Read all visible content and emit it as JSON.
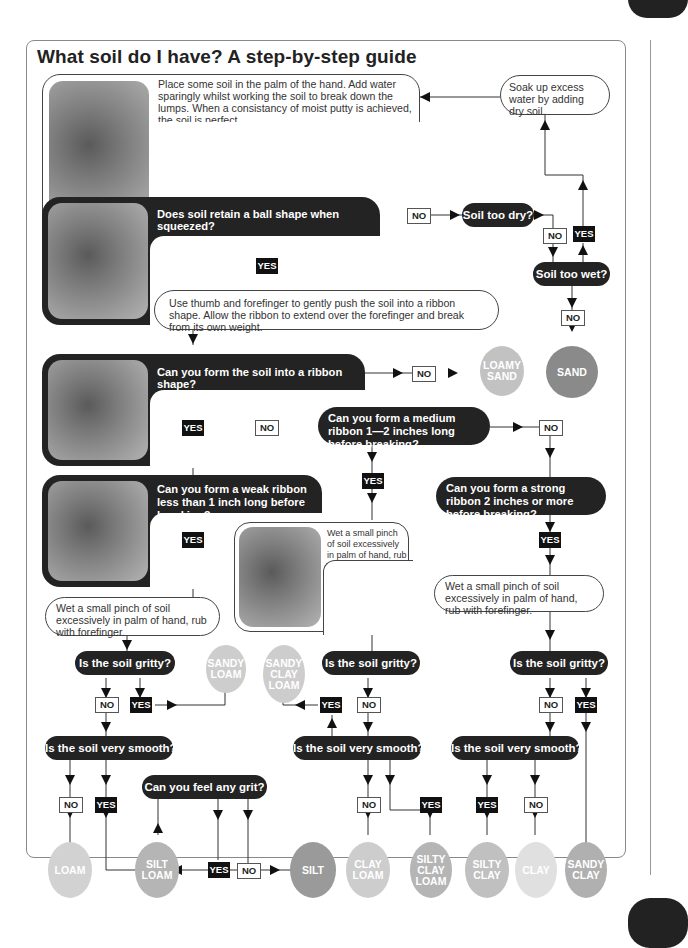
{
  "title": "What soil do I have? A step-by-step guide",
  "instructions": {
    "moisten": "Place some soil in the palm of the hand. Add water sparingly whilst working the soil to break down the lumps. When a consistancy of moist putty is achieved, the soil is perfect.",
    "soak": "Soak up excess water by adding dry soil.",
    "ribbon": "Use thumb and forefinger to gently push the soil into a ribbon shape. Allow the ribbon to extend over the forefinger and break from its own weight.",
    "wet_pinch": "Wet a small pinch of soil excessively in palm of hand, rub with forefinger."
  },
  "questions": {
    "ball": "Does soil retain a ball shape when squeezed?",
    "too_dry": "Soil too dry?",
    "too_wet": "Soil too wet?",
    "form_ribbon": "Can you form the soil into a ribbon shape?",
    "medium_ribbon": "Can you form a medium ribbon 1—2 inches long before breaking?",
    "weak_ribbon": "Can you form a weak ribbon less than 1 inch long before breaking?",
    "strong_ribbon": "Can you form a strong ribbon 2 inches or more before breaking?",
    "gritty": "Is the soil gritty?",
    "smooth": "Is the soil very smooth?",
    "grit": "Can you feel any grit?"
  },
  "labels": {
    "yes": "YES",
    "no": "NO"
  },
  "soils": {
    "loamy_sand": "LOAMY SAND",
    "sand": "SAND",
    "sandy_loam": "SANDY LOAM",
    "sandy_clay_loam": "SANDY CLAY LOAM",
    "loam": "LOAM",
    "silt_loam": "SILT LOAM",
    "silt": "SILT",
    "clay_loam": "CLAY LOAM",
    "silty_clay_loam": "SILTY CLAY LOAM",
    "silty_clay": "SILTY CLAY",
    "clay": "CLAY",
    "sandy_clay": "SANDY CLAY"
  },
  "colors": {
    "dark_box": "#232323",
    "sand": "#8a8a8a",
    "silt": "#9a9a9a",
    "mid_soil": "#b5b5b5",
    "light_soil": "#cdcdcd",
    "clay": "#e0e0e0"
  }
}
